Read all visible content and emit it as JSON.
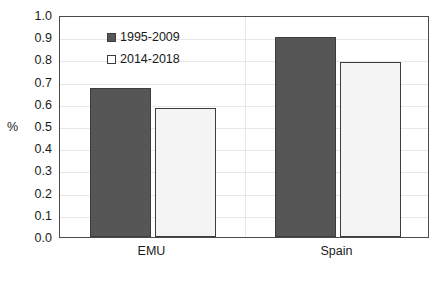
{
  "chart_data": {
    "type": "bar",
    "title": "",
    "xlabel": "",
    "ylabel": "%",
    "categories": [
      "EMU",
      "Spain"
    ],
    "series": [
      {
        "name": "1995-2009",
        "values": [
          0.67,
          0.9
        ],
        "color": "#565656",
        "swatch": "filled-dark-square"
      },
      {
        "name": "2014-2018",
        "values": [
          0.58,
          0.79
        ],
        "color": "#f4f4f4",
        "swatch": "open-white-square"
      }
    ],
    "ylim": [
      0.0,
      1.0
    ],
    "ytick_step": 0.1,
    "yticks": [
      "0.0",
      "0.1",
      "0.2",
      "0.3",
      "0.4",
      "0.5",
      "0.6",
      "0.7",
      "0.8",
      "0.9",
      "1.0"
    ],
    "grid": true,
    "grid_axis": "y",
    "legend_position": "inside-upper-left",
    "frame": true
  },
  "axis": {
    "y_title": "%",
    "y_title_at_value": "0.5"
  },
  "legend": {
    "items": [
      {
        "label": "1995-2009"
      },
      {
        "label": "2014-2018"
      }
    ]
  }
}
